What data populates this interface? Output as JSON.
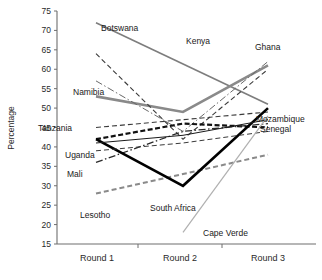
{
  "chart_data": {
    "type": "line",
    "title": "",
    "xlabel": "",
    "ylabel": "Percentage",
    "categories": [
      "Round 1",
      "Round 2",
      "Round 3"
    ],
    "ylim": [
      15,
      75
    ],
    "yticks": [
      15,
      20,
      25,
      30,
      35,
      40,
      45,
      50,
      55,
      60,
      65,
      70,
      75
    ],
    "grid": false,
    "legend": "inline-labels",
    "series": [
      {
        "name": "Botswana",
        "values": [
          72,
          null,
          51
        ],
        "style": "solid",
        "color": "#7d7d7d",
        "width": 1.6
      },
      {
        "name": "Namibia",
        "values": [
          53,
          49,
          61
        ],
        "style": "solid",
        "color": "#8a8a8a",
        "width": 2.6
      },
      {
        "name": "Kenya",
        "values": [
          64,
          42,
          60
        ],
        "style": "dashed",
        "color": "#3a3a3a",
        "width": 1.1
      },
      {
        "name": "Ghana",
        "values": [
          57,
          44,
          62
        ],
        "style": "dashdot",
        "color": "#6a6a6a",
        "width": 1.0
      },
      {
        "name": "Tanzania",
        "values": [
          45,
          47,
          49
        ],
        "style": "dashed",
        "color": "#3a3a3a",
        "width": 1.1
      },
      {
        "name": "Uganda",
        "values": [
          42,
          46,
          45
        ],
        "style": "heavydash",
        "color": "#111111",
        "width": 2.2
      },
      {
        "name": "Mali",
        "values": [
          36,
          44,
          46
        ],
        "style": "dashdot",
        "color": "#2a2a2a",
        "width": 1.3
      },
      {
        "name": "Lesotho",
        "values": [
          28,
          33,
          38
        ],
        "style": "dashed",
        "color": "#8a8a8a",
        "width": 2.0
      },
      {
        "name": "South Africa",
        "values": [
          42,
          30,
          50
        ],
        "style": "solid",
        "color": "#000000",
        "width": 2.6
      },
      {
        "name": "Mozambique",
        "values": [
          41,
          43,
          47
        ],
        "style": "solid",
        "color": "#1a1a1a",
        "width": 1.0
      },
      {
        "name": "Senegal",
        "values": [
          39,
          41,
          44
        ],
        "style": "dashed",
        "color": "#3a3a3a",
        "width": 1.0
      },
      {
        "name": "Cape Verde",
        "values": [
          null,
          18,
          48
        ],
        "style": "solid",
        "color": "#b0b0b0",
        "width": 1.2
      }
    ],
    "annotations": [
      {
        "text": "Botswana",
        "x": 101,
        "y": 31
      },
      {
        "text": "Kenya",
        "x": 186,
        "y": 44
      },
      {
        "text": "Ghana",
        "x": 255,
        "y": 50
      },
      {
        "text": "Namibia",
        "x": 73,
        "y": 95
      },
      {
        "text": "Tanzania",
        "x": 38,
        "y": 131
      },
      {
        "text": "Mozambique",
        "x": 256,
        "y": 122
      },
      {
        "text": "Senegal",
        "x": 260,
        "y": 132
      },
      {
        "text": "Uganda",
        "x": 65,
        "y": 158
      },
      {
        "text": "Mali",
        "x": 67,
        "y": 177
      },
      {
        "text": "Lesotho",
        "x": 80,
        "y": 218
      },
      {
        "text": "South Africa",
        "x": 150,
        "y": 211
      },
      {
        "text": "Cape Verde",
        "x": 203,
        "y": 236
      }
    ]
  },
  "axes": {
    "y_title": "Percentage",
    "y_labels": [
      "75",
      "70",
      "65",
      "60",
      "55",
      "50",
      "45",
      "40",
      "35",
      "30",
      "25",
      "20",
      "15"
    ],
    "x_labels": [
      "Round 1",
      "Round 2",
      "Round 3"
    ]
  }
}
